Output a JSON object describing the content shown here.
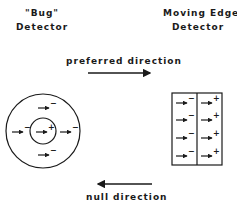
{
  "left_detector": {
    "title_line1": "\"Bug\"",
    "title_line2": "Detector"
  },
  "right_detector": {
    "title_line1": "Moving Edge",
    "title_line2": "Detector"
  },
  "preferred_label": "preferred direction",
  "null_label": "null direction",
  "bug_detector": {
    "center_sign": "+",
    "surround_signs": [
      "−",
      "−",
      "−",
      "−"
    ]
  },
  "edge_detector": {
    "left_column_signs": [
      "−",
      "−",
      "−",
      "−"
    ],
    "right_column_signs": [
      "+",
      "+",
      "+",
      "+"
    ]
  },
  "colors": {
    "ink": "#1a1a1a",
    "background": "#ffffff"
  }
}
